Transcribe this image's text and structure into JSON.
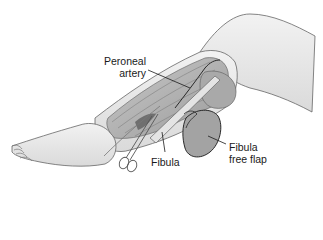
{
  "figure": {
    "colors": {
      "background": "#ffffff",
      "skin": "#e9e9e9",
      "skin_shadow": "#d2d2d2",
      "muscle": "#b8b8b8",
      "muscle_dark": "#8f8f8f",
      "outline": "#555555",
      "flap": "#a6a6a6",
      "line": "#1a1a1a"
    },
    "labels": [
      {
        "id": "peroneal-artery",
        "lines": [
          "Peroneal",
          "artery"
        ]
      },
      {
        "id": "fibula",
        "lines": [
          "Fibula"
        ]
      },
      {
        "id": "fibula-free-flap",
        "lines": [
          "Fibula",
          "free flap"
        ]
      }
    ]
  }
}
